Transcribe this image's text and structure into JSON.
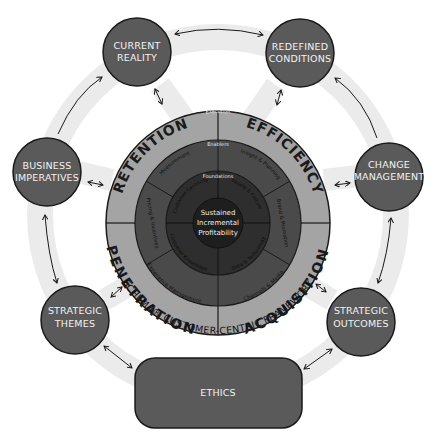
{
  "diagram": {
    "title": "SCHEMA® CUSTOMER-CENTRIC FRAMEWORK",
    "colors": {
      "background": "#ffffff",
      "band": "#ebebeb",
      "node_fill": "#5a5a5a",
      "node_text": "#f2f2f2",
      "outer_ring": "#a4a4a4",
      "enabler_ring": "#4a4a4a",
      "foundation_ring": "#2e2e2e",
      "core": "#1e1e1e",
      "stroke": "#1a1a1a"
    },
    "nodes": [
      {
        "id": "current-reality",
        "line1": "CURRENT",
        "line2": "REALITY"
      },
      {
        "id": "redefined-conditions",
        "line1": "REDEFINED",
        "line2": "CONDITIONS"
      },
      {
        "id": "business-imperatives",
        "line1": "BUSINESS",
        "line2": "IMPERATIVES"
      },
      {
        "id": "change-management",
        "line1": "CHANGE",
        "line2": "MANAGEMENT"
      },
      {
        "id": "strategic-themes",
        "line1": "STRATEGIC",
        "line2": "THEMES"
      },
      {
        "id": "strategic-outcomes",
        "line1": "STRATEGIC",
        "line2": "OUTCOMES"
      }
    ],
    "ethics": {
      "label": "ETHICS"
    },
    "wheel": {
      "outer_ring_label": "Execution",
      "segments": [
        "RETENTION",
        "EFFICIENCY",
        "PENETRATION",
        "ACQUISITION"
      ],
      "enablers_label": "Enablers",
      "enablers": [
        "Measurement",
        "Insight & Planning",
        "Brand & Promotion",
        "Channels & Media",
        "Experience Management",
        "Pricing & Incentives"
      ],
      "foundations_label": "Foundations",
      "foundations": [
        "Customer Centricity",
        "People & Culture",
        "Data & Technology",
        "Customer Knowledge"
      ],
      "core": {
        "line1": "Sustained",
        "line2": "Incremental",
        "line3": "Profitability"
      }
    }
  }
}
